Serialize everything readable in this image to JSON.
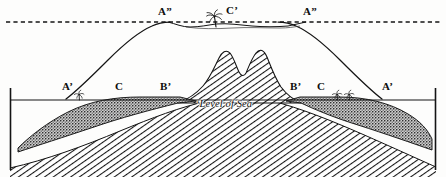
{
  "figure": {
    "width": 446,
    "height": 177,
    "background_color": "#fdfdfc",
    "ink_color": "#111111"
  },
  "lines": {
    "former_sea_level": {
      "name": "dashed upper line",
      "style": "dashed",
      "y": 22,
      "x_start": 6,
      "x_end": 440
    },
    "present_sea_level": {
      "name": "Level of Sea line",
      "style": "solid",
      "y": 100,
      "x_start": 10,
      "x_end": 436
    },
    "left_frame": {
      "x": 10,
      "y_top": 88,
      "y_bottom": 170
    },
    "right_frame": {
      "x": 436,
      "y_top": 88,
      "y_bottom": 170
    }
  },
  "labels": [
    {
      "id": "a2-left",
      "text": "A”",
      "x": 158,
      "y": 6,
      "role": "outer-reef-former-shore-left"
    },
    {
      "id": "cprime",
      "text": "C’",
      "x": 226,
      "y": 5,
      "role": "lagoon-atoll-center"
    },
    {
      "id": "a2-right",
      "text": "A”",
      "x": 303,
      "y": 6,
      "role": "outer-reef-former-shore-right"
    },
    {
      "id": "aprime-left",
      "text": "A’",
      "x": 62,
      "y": 81,
      "role": "present-shoreline-left"
    },
    {
      "id": "c-left",
      "text": "C",
      "x": 115,
      "y": 81,
      "role": "reef-flat-left"
    },
    {
      "id": "bprime-left",
      "text": "B’",
      "x": 160,
      "y": 81,
      "role": "barrier-reef-inner-left"
    },
    {
      "id": "bprime-right",
      "text": "B’",
      "x": 290,
      "y": 81,
      "role": "barrier-reef-inner-right"
    },
    {
      "id": "c-right",
      "text": "C",
      "x": 317,
      "y": 81,
      "role": "reef-flat-right"
    },
    {
      "id": "aprime-right",
      "text": "A’",
      "x": 382,
      "y": 81,
      "role": "present-shoreline-right"
    },
    {
      "id": "level-of-sea",
      "text": "‘Level of Sea",
      "x": 196,
      "y": 99,
      "role": "sea-level-caption",
      "italic": true
    }
  ],
  "palms": [
    {
      "id": "palm-lagoon-center",
      "x": 214,
      "y": 16,
      "size": "medium"
    },
    {
      "id": "palm-shore-left",
      "x": 79,
      "y": 93,
      "size": "small"
    },
    {
      "id": "palm-shore-right-a",
      "x": 337,
      "y": 93,
      "size": "small"
    },
    {
      "id": "palm-shore-right-b",
      "x": 349,
      "y": 93,
      "size": "small"
    }
  ],
  "regions": {
    "coral_deposit": {
      "name": "stippled coral / reef deposit",
      "fill": "stipple",
      "tone": "#4a4a4a"
    },
    "basement_rock": {
      "name": "hatched basement rock",
      "fill": "diagonal-hatch",
      "tone": "#1a1a1a"
    },
    "central_island": {
      "name": "twin-peaked central island",
      "fill": "diagonal-hatch",
      "tone": "#1a1a1a"
    }
  }
}
